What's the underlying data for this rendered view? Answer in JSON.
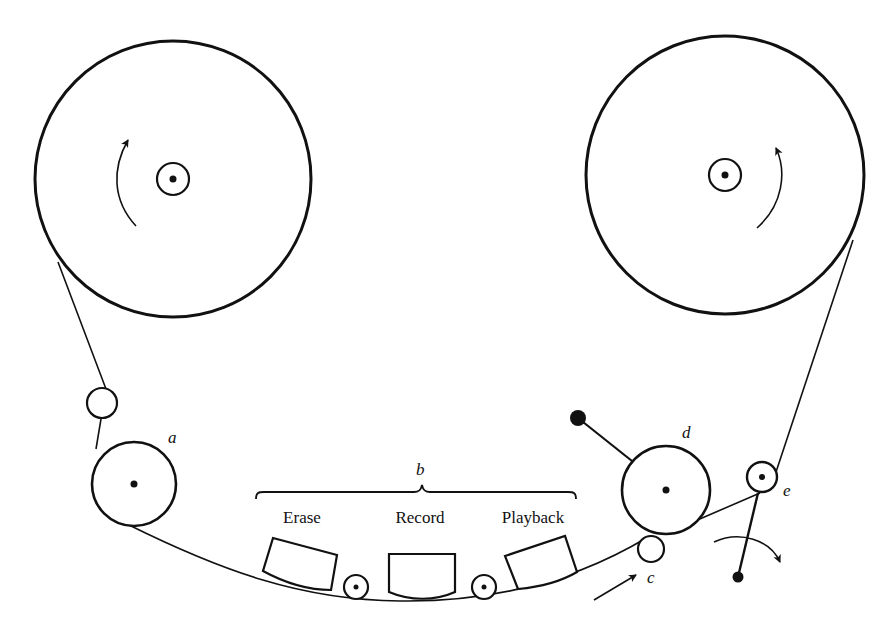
{
  "diagram": {
    "supply_reel": {
      "rotation": "counterclockwise"
    },
    "takeup_reel": {
      "rotation": "clockwise"
    },
    "labels": {
      "a": "a",
      "b": "b",
      "c": "c",
      "d": "d",
      "e": "e"
    },
    "heads": [
      {
        "label": "Erase"
      },
      {
        "label": "Record"
      },
      {
        "label": "Playback"
      }
    ],
    "colors": {
      "ink": "#111111",
      "background": "#ffffff"
    }
  }
}
